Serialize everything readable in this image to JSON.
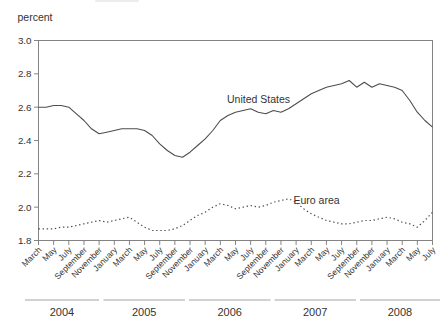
{
  "chart_data": {
    "type": "line",
    "title": "",
    "ylabel": "percent",
    "xlabel": "",
    "ylim": [
      1.8,
      3.0
    ],
    "y_tick_labels": [
      "3.0",
      "2.8",
      "2.6",
      "2.4",
      "2.2",
      "2.0",
      "1.8"
    ],
    "x_start": "March 2004",
    "x_end": "July 2008",
    "x_frequency": "monthly",
    "x_tick_every_n_months": 2,
    "x_tick_labels": [
      "March",
      "May",
      "July",
      "September",
      "November",
      "January",
      "March",
      "May",
      "July",
      "September",
      "November",
      "January",
      "March",
      "May",
      "July",
      "September",
      "November",
      "January",
      "March",
      "May",
      "July",
      "September",
      "November",
      "January",
      "March",
      "May",
      "July"
    ],
    "year_labels": [
      "2004",
      "2005",
      "2006",
      "2007",
      "2008"
    ],
    "grid": false,
    "legend_position": "inline annotations on lines",
    "series": [
      {
        "name": "United States",
        "line_style": "solid",
        "color": "#4d4d4d",
        "values": [
          2.6,
          2.6,
          2.61,
          2.61,
          2.6,
          2.56,
          2.52,
          2.47,
          2.44,
          2.45,
          2.46,
          2.47,
          2.47,
          2.47,
          2.46,
          2.43,
          2.38,
          2.34,
          2.31,
          2.3,
          2.33,
          2.37,
          2.41,
          2.46,
          2.52,
          2.55,
          2.57,
          2.58,
          2.59,
          2.57,
          2.56,
          2.58,
          2.57,
          2.59,
          2.62,
          2.65,
          2.68,
          2.7,
          2.72,
          2.73,
          2.74,
          2.76,
          2.72,
          2.75,
          2.72,
          2.74,
          2.73,
          2.72,
          2.7,
          2.64,
          2.57,
          2.52,
          2.48
        ]
      },
      {
        "name": "Euro area",
        "line_style": "dotted",
        "color": "#4d4d4d",
        "values": [
          1.87,
          1.87,
          1.87,
          1.88,
          1.88,
          1.89,
          1.9,
          1.91,
          1.92,
          1.91,
          1.92,
          1.93,
          1.94,
          1.91,
          1.88,
          1.86,
          1.86,
          1.86,
          1.87,
          1.89,
          1.92,
          1.95,
          1.97,
          2.0,
          2.02,
          2.01,
          1.99,
          2.0,
          2.01,
          2.0,
          2.01,
          2.03,
          2.04,
          2.05,
          2.03,
          1.99,
          1.96,
          1.94,
          1.92,
          1.91,
          1.9,
          1.9,
          1.91,
          1.92,
          1.92,
          1.93,
          1.94,
          1.93,
          1.91,
          1.9,
          1.88,
          1.92,
          1.97
        ]
      }
    ]
  },
  "colors": {
    "text": "#333333",
    "frame": "#777777",
    "year_rule": "#9a9a9a",
    "background": "#ffffff"
  }
}
